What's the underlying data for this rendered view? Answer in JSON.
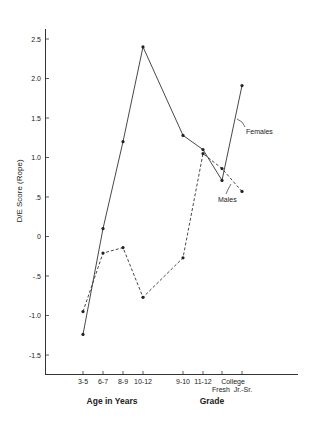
{
  "chart_data": {
    "type": "line",
    "title": "",
    "ylabel": "D/E Score (Rope)",
    "xlabel_groups": [
      {
        "label": "Age in Years",
        "categories": [
          "3-5",
          "6-7",
          "8-9",
          "10-12"
        ]
      },
      {
        "label": "Grade",
        "categories": [
          "9-10",
          "11-12",
          "College Fresh",
          "College Jr.-Sr."
        ]
      }
    ],
    "categories": [
      "3-5",
      "6-7",
      "8-9",
      "10-12",
      "9-10",
      "11-12",
      "Fresh",
      "Jr.-Sr."
    ],
    "tick_labels_line1": [
      "3-5",
      "6-7",
      "8-9",
      "10-12",
      "9-10",
      "11-12",
      "",
      ""
    ],
    "college_label": "College",
    "college_sub_labels": [
      "Fresh",
      "Jr.-Sr."
    ],
    "ylim": [
      -1.75,
      2.75
    ],
    "yticks": [
      2.5,
      2.0,
      1.5,
      1.0,
      0.5,
      0,
      -0.5,
      -1.0,
      -1.5
    ],
    "ytick_labels": [
      "2.5",
      "2.0",
      "1.5",
      "1.0",
      ".5",
      "0",
      "-.5",
      "-1.0",
      "-1.5"
    ],
    "grid": false,
    "series": [
      {
        "name": "Females",
        "style": "solid",
        "values": [
          -1.24,
          0.1,
          1.2,
          2.4,
          1.28,
          1.1,
          0.71,
          1.91
        ]
      },
      {
        "name": "Males",
        "style": "dashed",
        "values": [
          -0.95,
          -0.21,
          -0.14,
          -0.77,
          -0.27,
          1.05,
          0.86,
          0.57
        ]
      }
    ],
    "annotations": [
      {
        "text": "Females",
        "series": "Females"
      },
      {
        "text": "Males",
        "series": "Males"
      }
    ],
    "colors": {
      "line": "#333333",
      "background": "#ffffff"
    }
  }
}
